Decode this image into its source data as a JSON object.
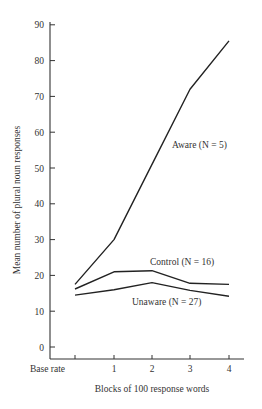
{
  "chart_data": {
    "type": "line",
    "title": "",
    "xlabel": "Blocks of 100 response words",
    "ylabel": "Mean number of plural noun responses",
    "categories": [
      "Base rate",
      "1",
      "2",
      "3",
      "4"
    ],
    "ylim": [
      0,
      90
    ],
    "yticks": [
      0,
      10,
      20,
      30,
      40,
      50,
      60,
      70,
      80,
      90
    ],
    "grid": false,
    "legend": "inline labels",
    "series": [
      {
        "name": "Aware",
        "label": "Aware (N = 5)",
        "n": 5,
        "values": [
          17.5,
          30,
          51,
          72,
          85.5
        ]
      },
      {
        "name": "Control",
        "label": "Control (N = 16)",
        "n": 16,
        "values": [
          16.2,
          21,
          21.3,
          17.8,
          17.5
        ]
      },
      {
        "name": "Unaware",
        "label": "Unaware (N = 27)",
        "n": 27,
        "values": [
          14.5,
          16,
          18,
          15.8,
          14.2
        ]
      }
    ],
    "colors": {
      "line": "#222222",
      "axis": "#333333",
      "background": "#ffffff"
    }
  }
}
